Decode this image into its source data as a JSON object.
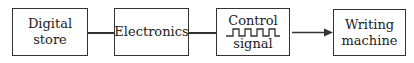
{
  "diagram": {
    "nodes": [
      {
        "id": "digital-store",
        "label_line1": "Digital",
        "label_line2": "store"
      },
      {
        "id": "electronics",
        "label": "Electronics"
      },
      {
        "id": "control-signal",
        "label_top": "Control",
        "label_bottom": "signal",
        "icon": "square-wave-icon"
      },
      {
        "id": "writing-machine",
        "label_line1": "Writing",
        "label_line2": "machine"
      }
    ],
    "edges": [
      {
        "from": "digital-store",
        "to": "electronics",
        "type": "line"
      },
      {
        "from": "electronics",
        "to": "control-signal",
        "type": "line"
      },
      {
        "from": "control-signal",
        "to": "writing-machine",
        "type": "arrow"
      }
    ]
  }
}
